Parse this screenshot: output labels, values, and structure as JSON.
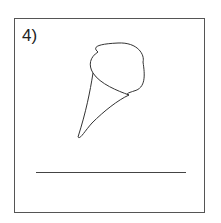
{
  "item": {
    "label": "4)",
    "drawing": "hand-drawn-ice-cream-cone-sketch",
    "answer_line": ""
  }
}
